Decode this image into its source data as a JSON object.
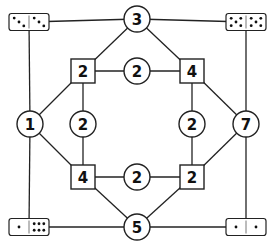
{
  "puzzle": {
    "circles": [
      {
        "id": "top",
        "label": "3",
        "x": 137,
        "y": 19
      },
      {
        "id": "bottom",
        "label": "5",
        "x": 137,
        "y": 227
      },
      {
        "id": "left",
        "label": "1",
        "x": 30,
        "y": 124
      },
      {
        "id": "right",
        "label": "7",
        "x": 246,
        "y": 124
      },
      {
        "id": "inner-top",
        "label": "2",
        "x": 137,
        "y": 71
      },
      {
        "id": "inner-bottom",
        "label": "2",
        "x": 137,
        "y": 177
      },
      {
        "id": "inner-left",
        "label": "2",
        "x": 83,
        "y": 124
      },
      {
        "id": "inner-right",
        "label": "2",
        "x": 192,
        "y": 124
      }
    ],
    "squares": [
      {
        "id": "sq-top-left",
        "label": "2",
        "x": 83,
        "y": 71
      },
      {
        "id": "sq-top-right",
        "label": "4",
        "x": 192,
        "y": 71
      },
      {
        "id": "sq-bottom-left",
        "label": "4",
        "x": 83,
        "y": 177
      },
      {
        "id": "sq-bottom-right",
        "label": "2",
        "x": 192,
        "y": 177
      }
    ],
    "dominoes": [
      {
        "id": "domino-top-left",
        "x": 29,
        "y": 22,
        "left": 3,
        "right": 3
      },
      {
        "id": "domino-top-right",
        "x": 246,
        "y": 22,
        "left": 5,
        "right": 5
      },
      {
        "id": "domino-bottom-left",
        "x": 29,
        "y": 227,
        "left": 1,
        "right": 6
      },
      {
        "id": "domino-bottom-right",
        "x": 246,
        "y": 227,
        "left": 1,
        "right": 1
      }
    ]
  }
}
